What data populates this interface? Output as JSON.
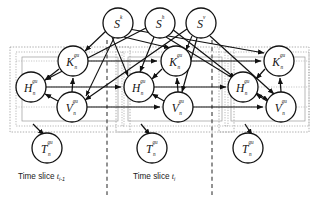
{
  "figure": {
    "background": "#ffffff",
    "stroke": "#1a1a1a",
    "plate_color": "#9a9a9a",
    "separator_color": "#3a3a3a"
  },
  "source_nodes": [
    {
      "name": "S-k",
      "base": "S",
      "sup": "k",
      "sub": "",
      "cx": 118,
      "cy": 23,
      "r": 15
    },
    {
      "name": "S-h",
      "base": "S",
      "sup": "h",
      "sub": "",
      "cx": 160,
      "cy": 23,
      "r": 15
    },
    {
      "name": "S-v",
      "base": "S",
      "sup": "v",
      "sub": "",
      "cx": 201,
      "cy": 23,
      "r": 15
    }
  ],
  "slices": [
    {
      "id": "slice-prev",
      "caption": "Time slice",
      "caption_var": "t",
      "caption_idx": "i-1",
      "nodes": {
        "K": {
          "base": "K",
          "sup": "gu",
          "sub": "n",
          "cx": 73,
          "cy": 61,
          "r": 15
        },
        "H": {
          "base": "H",
          "sup": "gu",
          "sub": "n",
          "cx": 31,
          "cy": 87,
          "r": 15
        },
        "V": {
          "base": "V",
          "sup": "gu",
          "sub": "n",
          "cx": 72,
          "cy": 107,
          "r": 15
        },
        "T": {
          "base": "T",
          "sup": "gu",
          "sub": "n",
          "cx": 47,
          "cy": 148,
          "r": 15
        }
      }
    },
    {
      "id": "slice-current",
      "caption": "Time slice",
      "caption_var": "t",
      "caption_idx": "i",
      "nodes": {
        "K": {
          "base": "K",
          "sup": "gu",
          "sub": "n",
          "cx": 176,
          "cy": 61,
          "r": 15
        },
        "H": {
          "base": "H",
          "sup": "gu",
          "sub": "n",
          "cx": 139,
          "cy": 87,
          "r": 15
        },
        "V": {
          "base": "V",
          "sup": "gu",
          "sub": "n",
          "cx": 178,
          "cy": 107,
          "r": 15
        },
        "T": {
          "base": "T",
          "sup": "gu",
          "sub": "n",
          "cx": 152,
          "cy": 148,
          "r": 15
        }
      }
    },
    {
      "id": "slice-next",
      "caption": "",
      "caption_var": "",
      "caption_idx": "",
      "nodes": {
        "K": {
          "base": "K",
          "sup": "gu",
          "sub": "n",
          "cx": 279,
          "cy": 61,
          "r": 15
        },
        "H": {
          "base": "H",
          "sup": "gu",
          "sub": "n",
          "cx": 243,
          "cy": 87,
          "r": 15
        },
        "V": {
          "base": "V",
          "sup": "gu",
          "sub": "n",
          "cx": 281,
          "cy": 107,
          "r": 15
        },
        "T": {
          "base": "T",
          "sup": "gu",
          "sub": "n",
          "cx": 248,
          "cy": 148,
          "r": 15
        }
      }
    }
  ],
  "captions": [
    {
      "name": "caption-slice-prev",
      "text": "Time slice",
      "var": "t",
      "idx": "i-1",
      "x": 18,
      "y": 178
    },
    {
      "name": "caption-slice-current",
      "text": "Time slice",
      "var": "t",
      "idx": "i",
      "x": 133,
      "y": 178
    }
  ],
  "separators": [
    {
      "name": "separator-prev-current",
      "x": 107
    },
    {
      "name": "separator-current-next",
      "x": 212
    }
  ]
}
